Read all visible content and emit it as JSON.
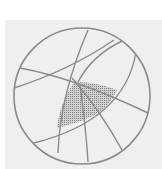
{
  "diagram": {
    "type": "stereonet",
    "colors": {
      "background": "#efefef",
      "stroke": "#8a8a8a",
      "hatch": "#8f8f8f"
    },
    "primitive_circle": {
      "cx": 82,
      "cy": 96,
      "r": 68
    },
    "arcs": [
      {
        "id": "arc-a",
        "path": "M20,68 Q75,78 148,113"
      },
      {
        "id": "arc-b",
        "path": "M14,88 Q70,70 114,40"
      },
      {
        "id": "arc-c",
        "path": "M88,30 Q60,95 58,153"
      },
      {
        "id": "arc-d",
        "path": "M136,52 Q125,120 34,143"
      },
      {
        "id": "arc-e",
        "path": "M72,78 Q100,110 122,150"
      },
      {
        "id": "arc-f",
        "path": "M80,84 Q86,130 88,162"
      },
      {
        "id": "arc-g",
        "path": "M124,40 Q92,55 78,82"
      }
    ],
    "hatched_regions": [
      {
        "id": "region-left",
        "path": "M76,80 Q60,100 57,128 Q76,124 97,114 Q86,96 76,80 Z"
      },
      {
        "id": "region-right",
        "path": "M78,82 Q95,82 117,90 Q110,106 97,114 Q86,96 78,82 Z"
      }
    ]
  }
}
